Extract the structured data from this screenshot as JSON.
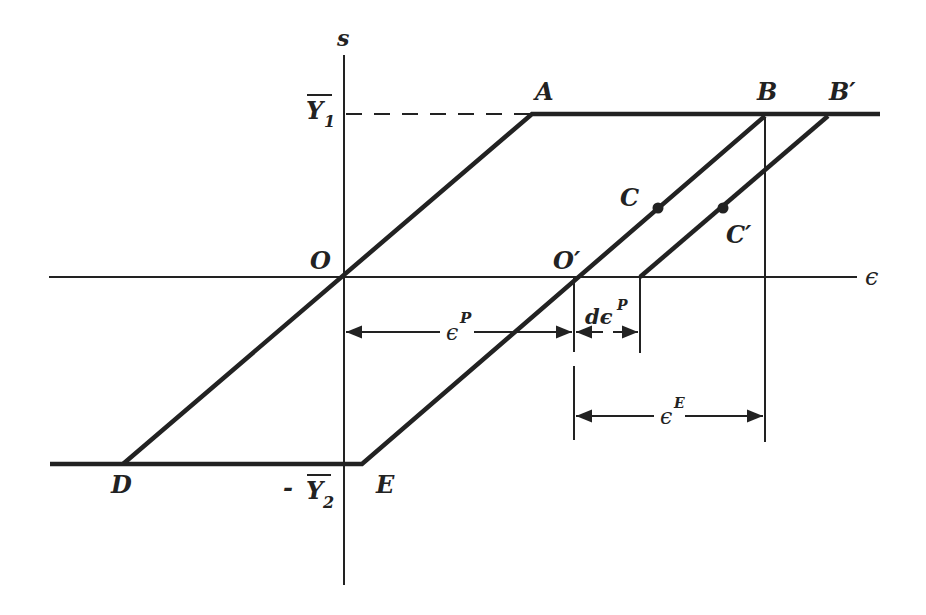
{
  "diagram": {
    "type": "stress-strain hysteresis (elastic-perfectly-plastic)",
    "axes": {
      "vertical_label": "s",
      "horizontal_label": "ϵ"
    },
    "levels": {
      "upper_yield": "Y",
      "upper_yield_sub": "1",
      "lower_yield_prefix": "-",
      "lower_yield": "Y",
      "lower_yield_sub": "2"
    },
    "points": {
      "O": "O",
      "O_prime": "O′",
      "A": "A",
      "B": "B",
      "B_prime": "B′",
      "C": "C",
      "C_prime": "C′",
      "D": "D",
      "E": "E"
    },
    "dimensions": {
      "plastic_strain": "ϵ",
      "plastic_strain_sup": "P",
      "plastic_increment": "dϵ",
      "plastic_increment_sup": "P",
      "elastic_strain": "ϵ",
      "elastic_strain_sup": "E"
    },
    "colors": {
      "ink": "#222222",
      "background": "#ffffff"
    }
  }
}
